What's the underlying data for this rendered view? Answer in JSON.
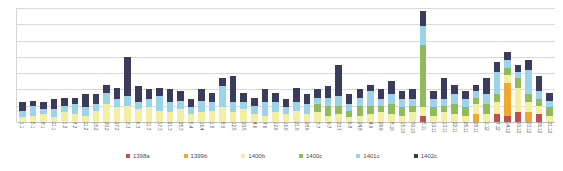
{
  "chart_data": {
    "type": "bar",
    "title": "",
    "subtitle": "",
    "xlabel": "",
    "ylabel": "",
    "stacked": true,
    "grid": true,
    "legend_position": "bottom",
    "ylim": [
      0,
      7
    ],
    "gridline_values": [
      7,
      6,
      5,
      4,
      3,
      2,
      1,
      0
    ],
    "categories": [
      "1.1",
      "5.1",
      "8.1",
      "11.1",
      "1.2",
      "7.2",
      "11.2",
      "15.2",
      "20.2",
      "27.2",
      "3.3",
      "6.3",
      "11.3",
      "17.3",
      "21.3",
      "25.3",
      "5.4",
      "16.4",
      "1.5",
      "8.5",
      "12.5",
      "20.5",
      "4.6",
      "7.6",
      "12.6",
      "16.6",
      "21.6",
      "28.6",
      "3.7",
      "9.7",
      "23.7",
      "9.8",
      "24.8",
      "4.9",
      "29.9",
      "8.10",
      "15.10",
      "30.10",
      "5.11",
      "10.11",
      "13.11",
      "22.11",
      "25.11",
      "28.11",
      "1.12",
      "7.12",
      "14.12",
      "20.12",
      "23.12",
      "26.12",
      "31.12"
    ],
    "series": [
      {
        "name": "1398a",
        "color": "#c0504d",
        "values": [
          0,
          0,
          0,
          0,
          0,
          0,
          0,
          0,
          0,
          0,
          0,
          0,
          0,
          0,
          0,
          0,
          0,
          0,
          0,
          0,
          0,
          0,
          0,
          0,
          0,
          0,
          0,
          0,
          0,
          0,
          0,
          0,
          0,
          0,
          0,
          0,
          0,
          0,
          0.4,
          0,
          0,
          0,
          0,
          0,
          0,
          0.5,
          0.4,
          0.6,
          0,
          0.5,
          0
        ]
      },
      {
        "name": "1399b",
        "color": "#f0a830",
        "values": [
          0,
          0,
          0,
          0,
          0,
          0,
          0,
          0,
          0,
          0,
          0,
          0,
          0,
          0,
          0,
          0,
          0,
          0,
          0,
          0,
          0,
          0,
          0,
          0,
          0,
          0,
          0,
          0,
          0,
          0,
          0,
          0,
          0,
          0,
          0,
          0,
          0,
          0,
          0,
          0,
          0,
          0,
          0,
          0.5,
          0,
          0,
          2.0,
          0,
          0.6,
          0,
          0
        ]
      },
      {
        "name": "1400b",
        "color": "#f2f0a0",
        "values": [
          0.3,
          0.4,
          0.5,
          0.3,
          0.6,
          0.5,
          0.4,
          0.7,
          1.1,
          0.9,
          1.0,
          0.8,
          0.9,
          0.7,
          0.6,
          0.8,
          0.5,
          0.6,
          0.7,
          0.9,
          0.6,
          0.8,
          0.5,
          0.4,
          0.6,
          0.5,
          0.7,
          0.5,
          0.6,
          0.4,
          0.5,
          0.3,
          0.4,
          0.5,
          0.6,
          0.5,
          0.4,
          0.6,
          0.5,
          0.4,
          0.6,
          0.5,
          0.4,
          0.6,
          0.5,
          0.7,
          0.5,
          1.5,
          0.6,
          0.5,
          0.4
        ]
      },
      {
        "name": "1400c",
        "color": "#8fbc5a",
        "values": [
          0,
          0,
          0,
          0,
          0,
          0,
          0,
          0,
          0,
          0,
          0,
          0,
          0,
          0,
          0,
          0,
          0,
          0,
          0,
          0,
          0,
          0,
          0,
          0,
          0,
          0,
          0,
          0,
          0.5,
          0.6,
          0.5,
          0.4,
          0.6,
          0.5,
          0.4,
          0.6,
          0.5,
          0.4,
          3.8,
          0.5,
          0.4,
          0.6,
          0.5,
          0.4,
          0.6,
          0.5,
          0.4,
          0.6,
          0.5,
          0.4,
          0.5
        ]
      },
      {
        "name": "1401c",
        "color": "#9bd4ea",
        "values": [
          0.4,
          0.6,
          0.3,
          0.5,
          0.4,
          0.6,
          0.5,
          0.4,
          0.7,
          0.5,
          0.6,
          0.4,
          0.5,
          0.9,
          0.6,
          0.5,
          0.4,
          0.7,
          0.5,
          1.3,
          0.6,
          0.4,
          0.5,
          0.8,
          0.6,
          0.4,
          0.5,
          0.6,
          0.4,
          0.5,
          0.6,
          0.4,
          0.5,
          0.9,
          0.4,
          0.6,
          0.5,
          0.4,
          1.2,
          0.5,
          0.4,
          0.6,
          0.5,
          0.4,
          0.6,
          1.4,
          0.5,
          0.4,
          1.5,
          0.5,
          0.4
        ]
      },
      {
        "name": "1402c",
        "color": "#3b3b5c",
        "values": [
          0.5,
          0.3,
          0.4,
          0.6,
          0.5,
          0.4,
          0.8,
          0.6,
          0.5,
          0.7,
          2.4,
          1.0,
          0.6,
          0.5,
          0.8,
          0.6,
          0.5,
          0.7,
          0.6,
          0.5,
          1.6,
          0.6,
          0.5,
          0.8,
          0.6,
          0.5,
          0.9,
          0.6,
          0.5,
          0.7,
          1.9,
          0.6,
          0.5,
          0.4,
          0.6,
          0.8,
          0.5,
          0.6,
          0.9,
          0.5,
          1.3,
          0.6,
          0.5,
          0.4,
          1.0,
          0.6,
          0.5,
          0.4,
          0.6,
          0.9,
          0.5
        ]
      }
    ]
  },
  "legend": {
    "items": [
      {
        "label": "1398a",
        "color": "#c0504d"
      },
      {
        "label": "1399b",
        "color": "#f0a830"
      },
      {
        "label": "1400b",
        "color": "#f2f0a0"
      },
      {
        "label": "1400c",
        "color": "#8fbc5a"
      },
      {
        "label": "1401c",
        "color": "#9bd4ea"
      },
      {
        "label": "1402c",
        "color": "#3b3b5c"
      }
    ]
  }
}
